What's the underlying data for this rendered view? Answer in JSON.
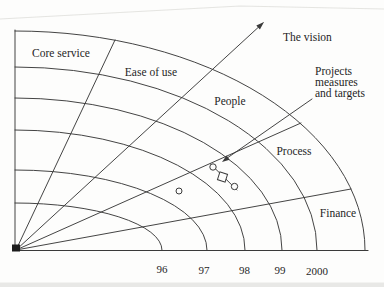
{
  "colors": {
    "ink": "#3a3a3a",
    "text": "#1f1f1f",
    "background": "#fdfdfc"
  },
  "fan": {
    "sectors": [
      {
        "label": "Core service"
      },
      {
        "label": "Ease of use"
      },
      {
        "label": "People"
      },
      {
        "label": "Process"
      },
      {
        "label": "Finance"
      }
    ],
    "years": [
      {
        "label": "96"
      },
      {
        "label": "97"
      },
      {
        "label": "98"
      },
      {
        "label": "99"
      },
      {
        "label": "2000"
      }
    ]
  },
  "annotations": {
    "vision": "The vision",
    "projects": {
      "line1": "Projects",
      "line2": "measures",
      "line3": "and targets"
    }
  },
  "markers": {
    "circle_points": 3,
    "square_points": 1
  }
}
